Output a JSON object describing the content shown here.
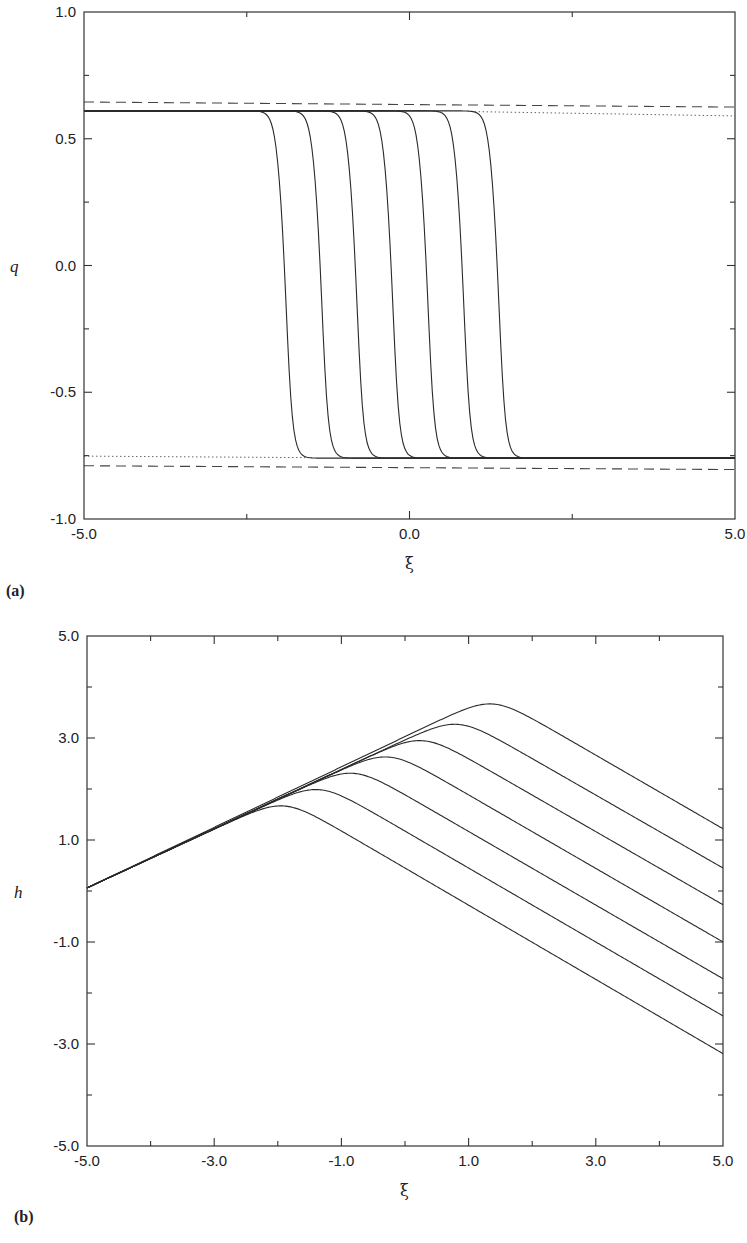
{
  "chart_data": [
    {
      "id": "a",
      "type": "line",
      "panel_label": "(a)",
      "xlabel": "ξ",
      "ylabel": "q",
      "xlim": [
        -5.0,
        5.0
      ],
      "ylim": [
        -1.0,
        1.0
      ],
      "x_tick_labels": [
        {
          "value": -5.0,
          "label": "-5.0"
        },
        {
          "value": 0.0,
          "label": "0.0"
        },
        {
          "value": 5.0,
          "label": "5.0"
        }
      ],
      "x_minor_ticks": [
        -2.5,
        2.5
      ],
      "y_tick_labels": [
        {
          "value": -1.0,
          "label": "-1.0"
        },
        {
          "value": -0.5,
          "label": "-0.5"
        },
        {
          "value": 0.0,
          "label": "0.0"
        },
        {
          "value": 0.5,
          "label": "0.5"
        },
        {
          "value": 1.0,
          "label": "1.0"
        }
      ],
      "y_minor_ticks": [
        -0.75,
        -0.25,
        0.25,
        0.75
      ],
      "grid": false,
      "kink_series": {
        "style": "solid",
        "description": "front profiles at successive times",
        "centers": [
          -1.91,
          -1.36,
          -0.82,
          -0.27,
          0.27,
          0.82,
          1.36
        ],
        "upper_plateau": 0.61,
        "lower_plateau": -0.76,
        "width": 0.12
      },
      "reference_lines": [
        {
          "name": "upper-dashed",
          "style": "dashed",
          "x": [
            -5.0,
            5.0
          ],
          "y": [
            0.645,
            0.625
          ]
        },
        {
          "name": "lower-dashed",
          "style": "dashed",
          "x": [
            -5.0,
            5.0
          ],
          "y": [
            -0.79,
            -0.805
          ]
        },
        {
          "name": "upper-dotted",
          "style": "dotted",
          "x": [
            1.0,
            5.0
          ],
          "y": [
            0.607,
            0.59
          ]
        },
        {
          "name": "lower-dotted",
          "style": "dotted",
          "x": [
            -5.0,
            -1.5
          ],
          "y": [
            -0.752,
            -0.758
          ]
        }
      ]
    },
    {
      "id": "b",
      "type": "line",
      "panel_label": "(b)",
      "xlabel": "ξ",
      "ylabel": "h",
      "xlim": [
        -5.0,
        5.0
      ],
      "ylim": [
        -5.0,
        5.0
      ],
      "x_tick_labels": [
        {
          "value": -5.0,
          "label": "-5.0"
        },
        {
          "value": -3.0,
          "label": "-3.0"
        },
        {
          "value": -1.0,
          "label": "-1.0"
        },
        {
          "value": 1.0,
          "label": "1.0"
        },
        {
          "value": 3.0,
          "label": "3.0"
        },
        {
          "value": 5.0,
          "label": "5.0"
        }
      ],
      "x_minor_ticks": [
        -4.0,
        -2.0,
        0.0,
        2.0,
        4.0
      ],
      "y_tick_labels": [
        {
          "value": -5.0,
          "label": "-5.0"
        },
        {
          "value": -3.0,
          "label": "-3.0"
        },
        {
          "value": -1.0,
          "label": "-1.0"
        },
        {
          "value": 1.0,
          "label": "1.0"
        },
        {
          "value": 3.0,
          "label": "3.0"
        },
        {
          "value": 5.0,
          "label": "5.0"
        }
      ],
      "y_minor_ticks": [
        -4.0,
        -2.0,
        0.0,
        2.0,
        4.0
      ],
      "grid": false,
      "ridge_series": {
        "style": "solid",
        "start_point": [
          -5.0,
          0.0
        ],
        "rising_slope": 0.585,
        "falling_slope": -0.73,
        "peak_xi": [
          -1.91,
          -1.36,
          -0.82,
          -0.27,
          0.27,
          0.82,
          1.37
        ],
        "peak_h": [
          1.78,
          2.1,
          2.42,
          2.74,
          3.06,
          3.38,
          3.78
        ],
        "end_h_at_xi_5": [
          -3.25,
          -2.51,
          -1.78,
          -1.06,
          -0.33,
          0.39,
          1.16
        ],
        "corner_rounding": 0.25
      }
    }
  ]
}
